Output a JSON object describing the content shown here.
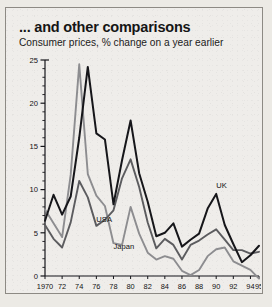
{
  "header": {
    "title": "... and other comparisons",
    "subtitle": "Consumer prices, % change on a year earlier"
  },
  "chart_data": {
    "type": "line",
    "title": "... and other comparisons",
    "subtitle": "Consumer prices, % change on a year earlier",
    "xlabel": "",
    "ylabel": "",
    "ylim": [
      0,
      25
    ],
    "yticks": [
      0,
      5,
      10,
      15,
      20,
      25
    ],
    "yticks_minor_step": 1,
    "xlim": [
      1970,
      1995
    ],
    "xtick_labels": [
      "1970",
      "72",
      "74",
      "76",
      "78",
      "80",
      "82",
      "84",
      "86",
      "88",
      "90",
      "92",
      "94",
      "95"
    ],
    "xtick_values": [
      1970,
      1972,
      1974,
      1976,
      1978,
      1980,
      1982,
      1984,
      1986,
      1988,
      1990,
      1992,
      1994,
      1995
    ],
    "grid": false,
    "legend": "inline-annotations",
    "x": [
      1970,
      1971,
      1972,
      1973,
      1974,
      1975,
      1976,
      1977,
      1978,
      1979,
      1980,
      1981,
      1982,
      1983,
      1984,
      1985,
      1986,
      1987,
      1988,
      1989,
      1990,
      1991,
      1992,
      1993,
      1994,
      1995
    ],
    "series": [
      {
        "name": "UK",
        "color": "#16161a",
        "label_x": 1990,
        "label_y": 10.2,
        "values": [
          6.4,
          9.4,
          7.1,
          9.2,
          16.0,
          24.2,
          16.5,
          15.8,
          8.3,
          13.4,
          18.0,
          11.9,
          8.6,
          4.6,
          5.0,
          6.1,
          3.4,
          4.2,
          4.9,
          7.8,
          9.5,
          5.9,
          3.7,
          1.6,
          2.4,
          3.5
        ]
      },
      {
        "name": "USA",
        "color": "#5c5c5f",
        "label_x": 1976,
        "label_y": 6.2,
        "values": [
          5.9,
          4.3,
          3.3,
          6.2,
          11.0,
          9.1,
          5.8,
          6.5,
          7.6,
          11.3,
          13.5,
          10.3,
          6.2,
          3.2,
          4.3,
          3.6,
          1.9,
          3.6,
          4.1,
          4.8,
          5.4,
          4.2,
          3.0,
          3.0,
          2.6,
          2.8
        ]
      },
      {
        "name": "Japan",
        "color": "#8d8d90",
        "label_x": 1978,
        "label_y": 3.1,
        "values": [
          7.7,
          6.1,
          4.5,
          11.7,
          24.5,
          11.8,
          9.3,
          8.1,
          3.8,
          3.6,
          8.0,
          4.9,
          2.7,
          1.9,
          2.3,
          2.0,
          0.6,
          0.1,
          0.7,
          2.3,
          3.1,
          3.3,
          1.7,
          1.2,
          0.7,
          -0.3
        ]
      }
    ]
  }
}
